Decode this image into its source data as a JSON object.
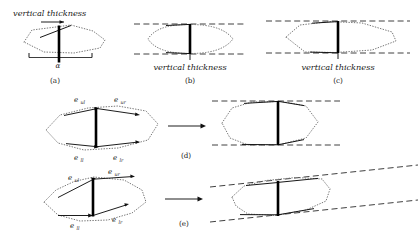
{
  "figure": {
    "label_vertical_thickness": "vertical thickness",
    "label_alpha": "α",
    "panels": [
      {
        "id": "a",
        "caption": "(a)",
        "annotation": "vertical thickness",
        "annotation_position": "above",
        "has_alpha": true,
        "alpha": "α",
        "description": "tilted polygon with horizontal baseline and slanted top edge"
      },
      {
        "id": "b",
        "caption": "(b)",
        "annotation": "vertical thickness",
        "annotation_position": "below",
        "has_alpha": false,
        "description": "lens shape between two horizontal dashed lines"
      },
      {
        "id": "c",
        "caption": "(c)",
        "annotation": "vertical thickness",
        "annotation_position": "below",
        "has_alpha": false,
        "description": "wide polygon between two horizontal dashed lines"
      },
      {
        "id": "d",
        "caption": "(d)",
        "annotation": "",
        "annotation_position": "none",
        "has_alpha": false,
        "description": "horizontal polygon with labeled edges transformed to flattened polygon"
      },
      {
        "id": "e",
        "caption": "(e)",
        "annotation": "",
        "annotation_position": "none",
        "has_alpha": false,
        "description": "tilted polygon with labeled edges transformed to sheared polygon"
      }
    ],
    "edge_labels": {
      "upper_left": "e",
      "upper_left_sub": "ul",
      "upper_right": "e",
      "upper_right_sub": "ur",
      "lower_left": "e",
      "lower_left_sub": "ll",
      "lower_right": "e",
      "lower_right_sub": "lr"
    },
    "colors": {
      "dotted_outline": "#767676",
      "dashed_support": "#2a2a2a",
      "thickness_bar": "#000000",
      "text": "#1a1a1a",
      "background": "#ffffff"
    },
    "transform_arrow": "→"
  }
}
